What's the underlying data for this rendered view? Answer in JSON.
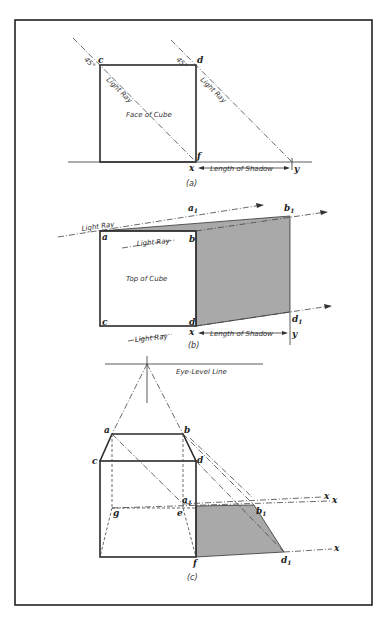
{
  "figure": {
    "border": {
      "x": 15,
      "y": 20,
      "width": 357,
      "height": 585
    },
    "colors": {
      "line": "#2a2a2a",
      "shadow_fill": "#a9a9a9",
      "background": "#ffffff"
    }
  },
  "panel_a": {
    "caption": "(a)",
    "face_label": "Face of Cube",
    "ray_label_left": "Light Ray",
    "ray_label_right": "Light Ray",
    "angle_left": "45°",
    "angle_right": "45°",
    "points": {
      "c": "c",
      "d": "d",
      "f": "f",
      "x": "x",
      "y": "y"
    },
    "dimension_label": "Length of Shadow"
  },
  "panel_b": {
    "caption": "(b)",
    "face_label": "Top of Cube",
    "ray_label_top": "Light Ray",
    "ray_label_mid": "Light Ray",
    "ray_label_bottom": "Light Ray",
    "points": {
      "a": "a",
      "b": "b",
      "c": "c",
      "d": "d",
      "a1": "a",
      "b1": "b",
      "d1": "d",
      "sub1": "1",
      "x": "x",
      "y": "y"
    },
    "dimension_label": "Length of Shadow"
  },
  "panel_c": {
    "caption": "(c)",
    "eye_level_label": "Eye-Level Line",
    "points": {
      "a": "a",
      "b": "b",
      "c": "c",
      "d": "d",
      "e": "e",
      "f": "f",
      "g": "g",
      "a1": "a",
      "b1": "b",
      "d1": "d",
      "sub1": "1",
      "x1": "x",
      "x2": "x",
      "x3": "x"
    }
  }
}
